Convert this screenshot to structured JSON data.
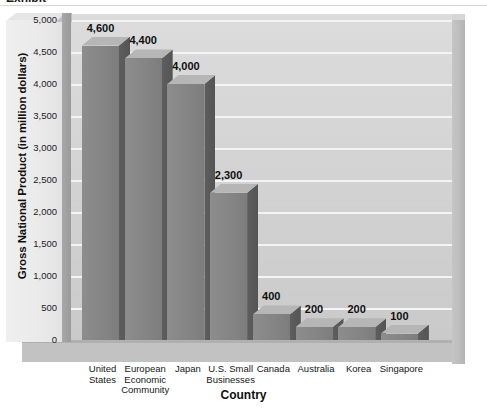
{
  "figure": {
    "top_cropped_text": "Exhibit",
    "background_color": "#ffffff",
    "bar_face_color": "#848484",
    "bar_top_color": "#b6b6b6",
    "bar_side_color": "#545454",
    "wall_color": "#d4d4d4",
    "gridline_color": "#f4f4f4",
    "text_color": "#101010"
  },
  "chart_data": {
    "type": "bar",
    "title": "",
    "xlabel": "Country",
    "ylabel": "Gross National Product (in million dollars)",
    "categories": [
      "United\nStates",
      "European\nEconomic\nCommunity",
      "Japan",
      "U.S. Small\nBusinesses",
      "Canada",
      "Australia",
      "Korea",
      "Singapore"
    ],
    "values": [
      4600,
      4400,
      4000,
      2300,
      400,
      200,
      200,
      100
    ],
    "value_labels": [
      "4,600",
      "4,400",
      "4,000",
      "2,300",
      "400",
      "200",
      "200",
      "100"
    ],
    "ylim": [
      0,
      5000
    ],
    "yticks": [
      0,
      500,
      1000,
      1500,
      2000,
      2500,
      3000,
      3500,
      4000,
      4500,
      5000
    ],
    "ytick_labels": [
      "5,000",
      "4,500",
      "4,000",
      "3,500",
      "3,000",
      "2,500",
      "2,000",
      "1,500",
      "1,000",
      "500",
      "0"
    ],
    "grid": true,
    "legend": false,
    "three_d": true
  }
}
